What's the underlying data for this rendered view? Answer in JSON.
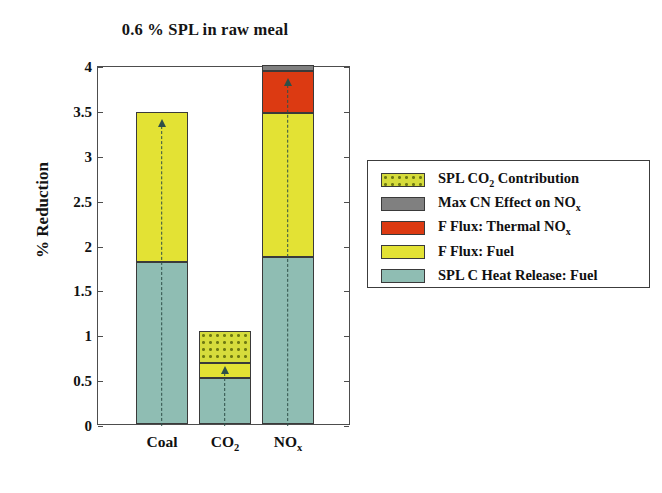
{
  "chart_data": {
    "type": "bar",
    "subtype": "stacked-bar",
    "title": "0.6 % SPL in raw meal",
    "xlabel": "",
    "ylabel": "% Reduction",
    "ylim": [
      0,
      4
    ],
    "ytick_labels": [
      "0",
      "0.5",
      "1",
      "1.5",
      "2",
      "2.5",
      "3",
      "3.5",
      "4"
    ],
    "ytick_values": [
      0,
      0.5,
      1,
      1.5,
      2,
      2.5,
      3,
      3.5,
      4
    ],
    "grid": false,
    "legend_position": "right-outside",
    "categories": [
      "Coal",
      "CO2",
      "NOx"
    ],
    "category_labels_html": [
      "Coal",
      "CO<sub>2</sub>",
      "NO<sub>x</sub>"
    ],
    "series": [
      {
        "name": "SPL C Heat Release: Fuel",
        "color": "#8FBDB3",
        "pattern": "solid",
        "values": [
          1.8,
          0.51,
          1.86
        ]
      },
      {
        "name": "F Flux: Fuel",
        "color": "#E3E234",
        "pattern": "solid",
        "values": [
          1.68,
          0.17,
          1.61
        ]
      },
      {
        "name": "F Flux: Thermal NOx",
        "color": "#DC3A12",
        "pattern": "solid",
        "values": [
          0,
          0,
          0.46
        ]
      },
      {
        "name": "Max CN Effect on NOx",
        "color": "#808080",
        "pattern": "solid",
        "values": [
          0,
          0,
          0.07
        ]
      },
      {
        "name": "SPL CO2 Contribution",
        "color": "#D6DC3C",
        "pattern": "dotted",
        "values": [
          0,
          0.36,
          0
        ]
      }
    ],
    "totals": [
      3.48,
      1.04,
      4.0
    ],
    "annotations": [
      {
        "category": "Coal",
        "type": "dashed-up-arrow",
        "from": 0,
        "to": 3.42
      },
      {
        "category": "CO2",
        "type": "dashed-up-arrow",
        "from": 0,
        "to": 0.67
      },
      {
        "category": "NOx",
        "type": "dashed-up-arrow",
        "from": 0,
        "to": 3.88
      }
    ]
  },
  "legend": {
    "items": [
      {
        "label": "SPL CO",
        "sub": "2",
        "label_tail": " Contribution",
        "color": "#D6DC3C",
        "pattern": "dotted",
        "swatch_name": "swatch-spl-co2-contribution"
      },
      {
        "label": "Max CN Effect on NO",
        "sub": "x",
        "label_tail": "",
        "color": "#808080",
        "pattern": "solid",
        "swatch_name": "swatch-max-cn-effect"
      },
      {
        "label": "F Flux: Thermal NO",
        "sub": "x",
        "label_tail": "",
        "color": "#DC3A12",
        "pattern": "solid",
        "swatch_name": "swatch-f-flux-thermal-nox"
      },
      {
        "label": "F Flux: Fuel",
        "sub": "",
        "label_tail": "",
        "color": "#E3E234",
        "pattern": "solid",
        "swatch_name": "swatch-f-flux-fuel"
      },
      {
        "label": "SPL C Heat Release: Fuel",
        "sub": "",
        "label_tail": "",
        "color": "#8FBDB3",
        "pattern": "solid",
        "swatch_name": "swatch-spl-c-heat-release-fuel"
      }
    ]
  },
  "colors": {
    "teal": "#8FBDB3",
    "yellow": "#E3E234",
    "yellow_dotted": "#D6DC3C",
    "red": "#DC3A12",
    "gray": "#808080",
    "axis": "#4d4d4d",
    "text": "#111111",
    "arrow": "#2f4f48"
  }
}
